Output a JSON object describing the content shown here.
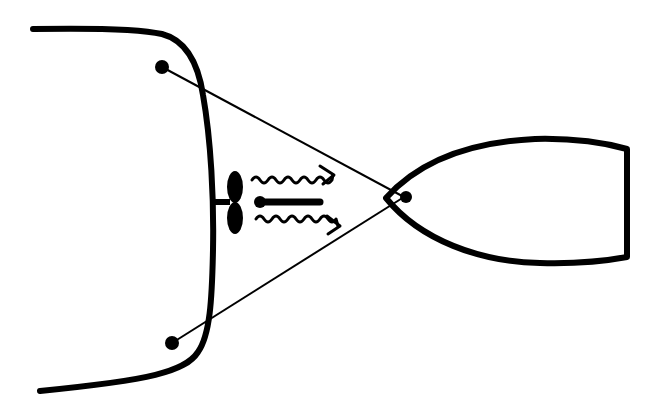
{
  "diagram": {
    "colors": {
      "ink": "#000000",
      "background": "#ffffff"
    },
    "elements": [
      {
        "id": "large-vessel-hull",
        "label": "large vessel (stern)"
      },
      {
        "id": "propeller",
        "label": "propeller"
      },
      {
        "id": "tow-line-upper",
        "label": "tow line"
      },
      {
        "id": "tow-line-lower",
        "label": "tow line"
      },
      {
        "id": "small-boat",
        "label": "small boat"
      },
      {
        "id": "thrust-arrow",
        "label": "thrust"
      },
      {
        "id": "wash-arrows",
        "label": "propeller wash"
      }
    ]
  }
}
